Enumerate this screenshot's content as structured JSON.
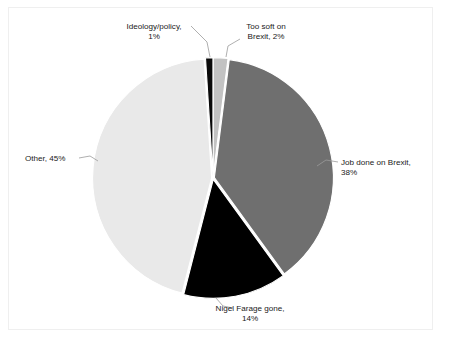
{
  "chart_data": {
    "type": "pie",
    "title": "",
    "subtitle": "",
    "xlabel": "",
    "ylabel": "",
    "legend_position": "none",
    "grid": false,
    "labels_format": "category, percent",
    "total_percent": 100,
    "categories": [
      "Too soft on Brexit",
      "Job done on Brexit",
      "Nigel Farage gone",
      "Other",
      "Ideology/policy"
    ],
    "values": [
      2,
      38,
      14,
      45,
      1
    ],
    "slices": [
      {
        "id": "too-soft-on-brexit",
        "category": "Too soft on Brexit",
        "value": 2,
        "percent_text": "2%",
        "label_line1": "Too soft on",
        "label_line2": "Brexit, 2%",
        "color": "#c2c2c2",
        "label_x": 266,
        "label_y": 29,
        "label_anchor": "middle",
        "leader": "M 240,39 L 228,46 L 226,57"
      },
      {
        "id": "job-done-on-brexit",
        "category": "Job done on Brexit",
        "value": 38,
        "percent_text": "38%",
        "label_line1": "Job done on Brexit,",
        "label_line2": "38%",
        "color": "#6f6f6f",
        "label_x": 341,
        "label_y": 165,
        "label_anchor": "start",
        "leader": "M 338,162 L 326,160 L 317,166"
      },
      {
        "id": "nigel-farage-gone",
        "category": "Nigel Farage gone",
        "value": 14,
        "percent_text": "14%",
        "label_line1": "Nigel Farage gone,",
        "label_line2": "14%",
        "color": "#000000",
        "label_x": 250,
        "label_y": 311,
        "label_anchor": "middle",
        "leader": "M 216,298 L 223,306 L 233,308"
      },
      {
        "id": "other",
        "category": "Other",
        "value": 45,
        "percent_text": "45%",
        "label_line1": "Other, 45%",
        "label_line2": "",
        "color": "#e9e9e9",
        "label_x": 25,
        "label_y": 161,
        "label_anchor": "start",
        "leader": "M 79,158 L 90,156 L 98,161"
      },
      {
        "id": "ideology-policy",
        "category": "Ideology/policy",
        "value": 1,
        "percent_text": "1%",
        "label_line1": "Ideology/policy,",
        "label_line2": "1%",
        "color": "#0a0a0a",
        "label_x": 154,
        "label_y": 29,
        "label_anchor": "middle",
        "leader": "M 191,26 L 207,42 L 210,57"
      }
    ],
    "geometry": {
      "center_x": 213,
      "center_y": 178,
      "radius": 119,
      "start_angle_deg": -90,
      "explode_px": 1.4,
      "direction": "clockwise"
    },
    "colors": {
      "background": "#ffffff",
      "frame_border": "#efefef",
      "label_text": "#1a1a1a",
      "leader_line": "#9a9a9a"
    }
  }
}
